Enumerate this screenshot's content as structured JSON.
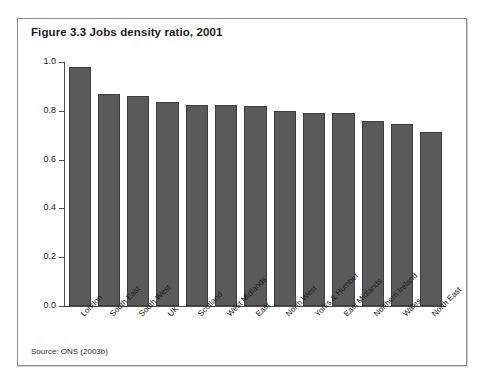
{
  "figure": {
    "title": "Figure 3.3 Jobs density ratio, 2001",
    "source": "Source: ONS (2003b)"
  },
  "chart_data": {
    "type": "bar",
    "title": "Figure 3.3 Jobs density ratio, 2001",
    "xlabel": "",
    "ylabel": "Jobs per working age (16-59/64) resident",
    "ylim": [
      0.0,
      1.0
    ],
    "yticks": [
      "0.0",
      "0.2",
      "0.4",
      "0.6",
      "0.8",
      "1.0"
    ],
    "ytick_values": [
      0.0,
      0.2,
      0.4,
      0.6,
      0.8,
      1.0
    ],
    "grid": false,
    "legend": "none",
    "bar_color": "#5a5a5a",
    "categories": [
      "London",
      "South East",
      "South West",
      "UK",
      "Scotland",
      "West Midlands",
      "East",
      "North West",
      "Yorks & Humber",
      "East Midlands",
      "Northern Ireland",
      "Wales",
      "North East"
    ],
    "values": [
      0.98,
      0.87,
      0.86,
      0.835,
      0.825,
      0.825,
      0.82,
      0.8,
      0.79,
      0.79,
      0.76,
      0.745,
      0.715
    ]
  }
}
